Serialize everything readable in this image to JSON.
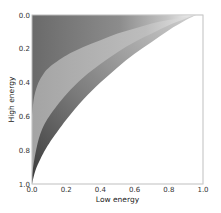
{
  "chart_data": {
    "type": "area",
    "title": "",
    "xlabel": "Low energy",
    "ylabel": "High energy",
    "xlim": [
      0.0,
      1.0
    ],
    "ylim": [
      1.0,
      0.0
    ],
    "y_inverted": true,
    "grid": false,
    "legend": null,
    "x_ticks": [
      "0.0",
      "0.2",
      "0.4",
      "0.6",
      "0.8",
      "1.0"
    ],
    "y_ticks": [
      "0.0",
      "0.2",
      "0.4",
      "0.6",
      "0.8",
      "1.0"
    ],
    "series": [
      {
        "name": "outer-boundary",
        "fill": "#5a5a5a",
        "x": [
          0.0,
          0.02,
          0.05,
          0.1,
          0.2,
          0.3,
          0.4,
          0.5,
          0.6,
          0.7,
          0.8,
          0.9,
          0.96
        ],
        "y": [
          1.0,
          0.92,
          0.85,
          0.76,
          0.62,
          0.5,
          0.4,
          0.31,
          0.23,
          0.16,
          0.09,
          0.03,
          0.0
        ]
      },
      {
        "name": "middle-boundary",
        "fill": "#a8a8a8",
        "x": [
          0.0,
          0.02,
          0.05,
          0.1,
          0.2,
          0.3,
          0.4,
          0.5,
          0.6,
          0.7,
          0.8,
          0.9,
          0.95
        ],
        "y": [
          0.95,
          0.82,
          0.7,
          0.6,
          0.47,
          0.37,
          0.29,
          0.22,
          0.16,
          0.11,
          0.06,
          0.02,
          0.0
        ]
      },
      {
        "name": "inner-boundary",
        "fill": "#6e6e6e",
        "x": [
          0.0,
          0.01,
          0.03,
          0.06,
          0.1,
          0.2,
          0.3,
          0.4,
          0.5,
          0.6,
          0.7,
          0.8,
          0.9,
          0.93
        ],
        "y": [
          0.6,
          0.5,
          0.42,
          0.36,
          0.31,
          0.24,
          0.19,
          0.15,
          0.11,
          0.08,
          0.05,
          0.03,
          0.01,
          0.0
        ]
      }
    ]
  }
}
